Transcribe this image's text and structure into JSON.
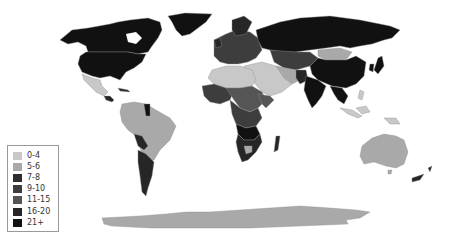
{
  "map": {
    "type": "choropleth",
    "region": "world",
    "background": "#ffffff",
    "border_color": "#9a9a9a"
  },
  "legend": {
    "items": [
      {
        "label": "0-4",
        "color": "#c8c8c8"
      },
      {
        "label": "5-6",
        "color": "#a9a9a9"
      },
      {
        "label": "7-8",
        "color": "#2e2e2e"
      },
      {
        "label": "9-10",
        "color": "#3d3d3d"
      },
      {
        "label": "11-15",
        "color": "#555555"
      },
      {
        "label": "16-20",
        "color": "#262626"
      },
      {
        "label": "21+",
        "color": "#111111"
      }
    ]
  },
  "colors": {
    "c04": "#c8c8c8",
    "c56": "#a9a9a9",
    "c78": "#2e2e2e",
    "c910": "#3d3d3d",
    "c1115": "#555555",
    "c1620": "#262626",
    "c21": "#111111"
  }
}
